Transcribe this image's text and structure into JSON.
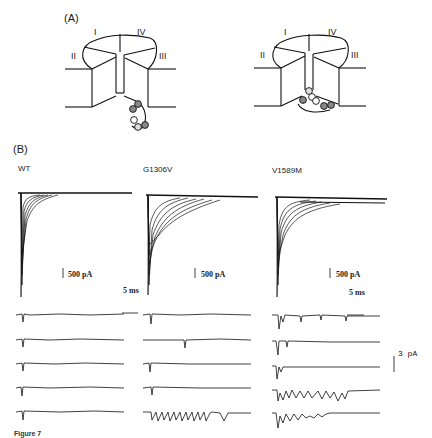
{
  "figure": {
    "panel_a": {
      "label": "(A)",
      "left_diagram": {
        "domains": [
          "I",
          "IV",
          "II",
          "III"
        ],
        "description": "channel schematic with inactivation gate outside pore (open)"
      },
      "right_diagram": {
        "domains": [
          "I",
          "IV",
          "II",
          "III"
        ],
        "description": "channel schematic with inactivation gate occluding pore"
      }
    },
    "panel_b": {
      "label": "(B)",
      "conditions": [
        "WT",
        "G1306V",
        "V1589M"
      ],
      "macroscopic_scale": "500 pA",
      "time_scale": "5 ms",
      "single_channel_scale": "3 pA",
      "single_channel_sweeps_per_condition": 5
    },
    "caption_fragment": "Figure 7"
  }
}
